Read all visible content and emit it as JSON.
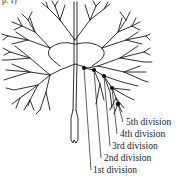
{
  "figure": {
    "top_fragment": "p. 1)",
    "ink_color": "#1a1a1a",
    "dot_color": "#111111",
    "labels": [
      {
        "text": "5th division",
        "x": 126,
        "y": 117
      },
      {
        "text": "4th division",
        "x": 120,
        "y": 129
      },
      {
        "text": "3rd division",
        "x": 112,
        "y": 141
      },
      {
        "text": "2nd division",
        "x": 104,
        "y": 153
      },
      {
        "text": "1st division",
        "x": 93,
        "y": 165
      }
    ]
  }
}
